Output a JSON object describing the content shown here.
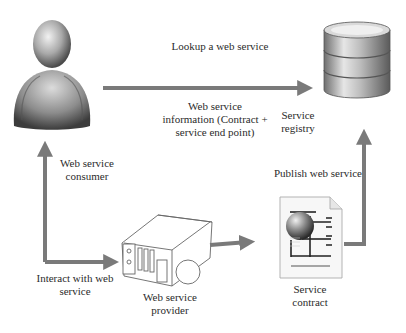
{
  "diagram": {
    "type": "web service architecture",
    "nodes": {
      "consumer": {
        "label": "Web service\nconsumer",
        "icon": "person-icon"
      },
      "registry": {
        "label": "Service\nregistry",
        "icon": "database-icon"
      },
      "provider": {
        "label": "Web service\nprovider",
        "icon": "server-icon"
      },
      "contract": {
        "label": "Service\ncontract",
        "icon": "document-globe-icon"
      }
    },
    "edges": {
      "lookup": {
        "from": "consumer",
        "to": "registry",
        "label": "Lookup a web service"
      },
      "info": {
        "label": "Web service\ninformation (Contract +\nservice end point)"
      },
      "interact": {
        "from": "provider",
        "to": "consumer",
        "label": "Interact with web\nservice"
      },
      "provider_to_contract": {
        "from": "provider",
        "to": "contract",
        "label": ""
      },
      "publish": {
        "from": "contract",
        "to": "registry",
        "label": "Publish web service"
      }
    },
    "colors": {
      "arrow": "#7a7a7a",
      "text": "#2b2b2b",
      "background": "#ffffff"
    }
  }
}
